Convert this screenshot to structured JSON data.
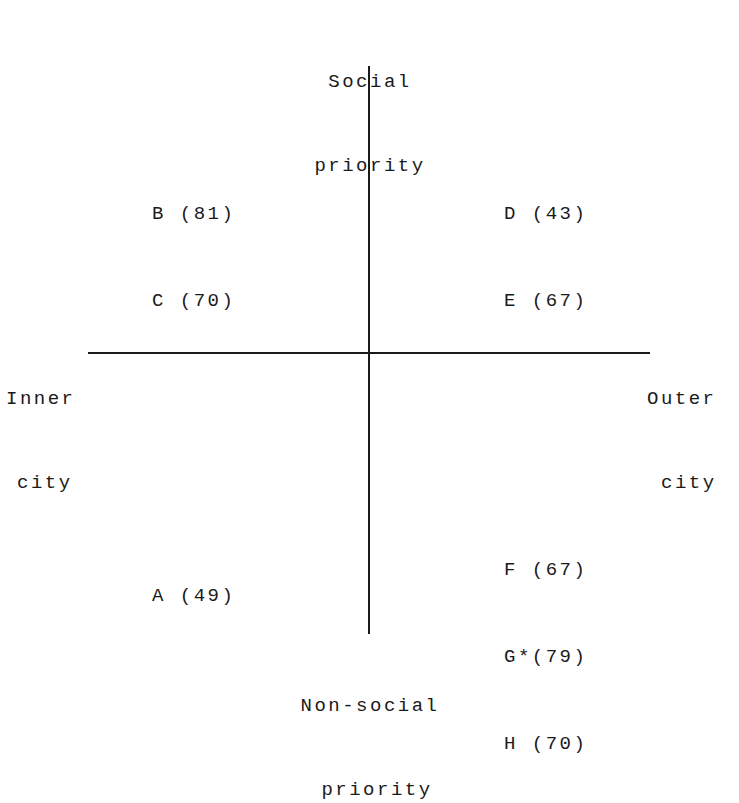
{
  "axes": {
    "top": [
      "Social",
      "priority"
    ],
    "bottom": [
      "Non-social",
      "priority"
    ],
    "left": [
      "Inner",
      "city"
    ],
    "right": [
      "Outer",
      "city"
    ]
  },
  "quadrants": {
    "top_left": [
      {
        "id": "B",
        "value": "(81)",
        "text": "B (81)"
      },
      {
        "id": "C",
        "value": "(70)",
        "text": "C (70)"
      }
    ],
    "top_right": [
      {
        "id": "D",
        "value": "(43)",
        "text": "D (43)"
      },
      {
        "id": "E",
        "value": "(67)",
        "text": "E (67)"
      }
    ],
    "bottom_left": [
      {
        "id": "A",
        "value": "(49)",
        "text": "A (49)"
      }
    ],
    "bottom_right": [
      {
        "id": "F",
        "value": "(67)",
        "text": "F (67)"
      },
      {
        "id": "G*",
        "value": "(79)",
        "text": "G*(79)"
      },
      {
        "id": "H",
        "value": "(70)",
        "text": "H (70)"
      }
    ]
  }
}
